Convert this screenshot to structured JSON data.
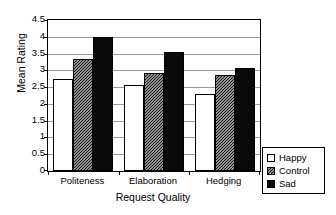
{
  "chart_data": {
    "type": "bar",
    "title": "",
    "xlabel": "Request Quality",
    "ylabel": "Mean Rating",
    "categories": [
      "Politeness",
      "Elaboration",
      "Hedging"
    ],
    "series": [
      {
        "name": "Happy",
        "values": [
          2.75,
          2.55,
          2.3
        ],
        "fill": "white",
        "color": "#ffffff"
      },
      {
        "name": "Control",
        "values": [
          3.35,
          2.93,
          2.87
        ],
        "fill": "hatch",
        "color": "#ffffff"
      },
      {
        "name": "Sad",
        "values": [
          4.0,
          3.55,
          3.08
        ],
        "fill": "solid",
        "color": "#0a0a0a"
      }
    ],
    "ylim": [
      0,
      4.5
    ],
    "ytick_step": 0.5,
    "yticks": [
      "4.5",
      "4",
      "3.5",
      "3",
      "2.5",
      "2",
      "1.5",
      "1",
      "0.5",
      "0"
    ],
    "ytick_values": [
      4.5,
      4,
      3.5,
      3,
      2.5,
      2,
      1.5,
      1,
      0.5,
      0
    ],
    "grid": true,
    "grid_axis": "y",
    "grid_color": "#9a9a9a",
    "legend_position": "bottom-right-outside",
    "axis_color": "#000000",
    "background": "#ffffff"
  },
  "legend": {
    "items": [
      {
        "label": "Happy"
      },
      {
        "label": "Control"
      },
      {
        "label": "Sad"
      }
    ]
  }
}
